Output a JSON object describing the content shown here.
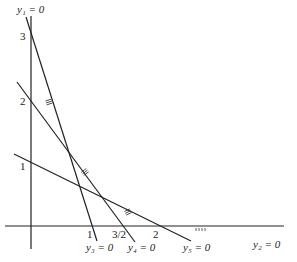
{
  "diagram": {
    "type": "linear-constraint-plot",
    "axes": {
      "vertical_label": "y₁ = 0",
      "horizontal_label": "y₂ = 0",
      "vertical_ticks": [
        "3",
        "2",
        "1"
      ],
      "horizontal_ticks": [
        "1",
        "3/2",
        "2"
      ]
    },
    "lines": [
      {
        "id": "y3",
        "label": "y₃ = 0",
        "intercept_vertical": 3,
        "intercept_horizontal": 1
      },
      {
        "id": "y4",
        "label": "y₄ = 0",
        "intercept_vertical": 2,
        "intercept_horizontal": 1.5
      },
      {
        "id": "y5",
        "label": "y₅ = 0",
        "intercept_vertical": 1,
        "intercept_horizontal": 2
      }
    ],
    "hatch_marks": "shading indicating feasible side of each constraint"
  }
}
